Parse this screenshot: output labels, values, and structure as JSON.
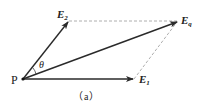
{
  "diagram": {
    "type": "vector-parallelogram",
    "caption": "（a）",
    "origin_label": "P",
    "angle_label": "θ",
    "vectors": [
      {
        "name": "E",
        "sub": "2",
        "from": [
          23,
          79
        ],
        "to": [
          69,
          21
        ]
      },
      {
        "name": "E",
        "sub": "1",
        "from": [
          23,
          79
        ],
        "to": [
          134,
          79
        ]
      },
      {
        "name": "E",
        "sub": "q",
        "from": [
          23,
          79
        ],
        "to": [
          178,
          21
        ]
      }
    ],
    "dashed_lines": [
      {
        "from": [
          69,
          21
        ],
        "to": [
          178,
          21
        ]
      },
      {
        "from": [
          134,
          79
        ],
        "to": [
          178,
          21
        ]
      }
    ],
    "colors": {
      "stroke": "#2a2a2a",
      "dashed": "#9a9a9a",
      "text": "#222222"
    }
  }
}
